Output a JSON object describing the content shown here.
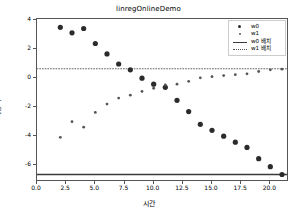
{
  "chart_data": {
    "type": "scatter",
    "title": "linregOnlineDemo",
    "xlabel": "시간",
    "ylabel": "가중치",
    "xlim": [
      0.0,
      21.6
    ],
    "ylim": [
      -7.2,
      4.1
    ],
    "xticks": [
      "0.0",
      "2.5",
      "5.0",
      "7.5",
      "10.0",
      "12.5",
      "15.0",
      "17.5",
      "20.0"
    ],
    "xtick_values": [
      0.0,
      2.5,
      5.0,
      7.5,
      10.0,
      12.5,
      15.0,
      17.5,
      20.0
    ],
    "yticks": [
      "4",
      "2",
      "0",
      "-2",
      "-4",
      "-6"
    ],
    "ytick_values": [
      4,
      2,
      0,
      -2,
      -4,
      -6
    ],
    "grid": false,
    "legend_position": "upper right",
    "x": [
      2,
      3,
      4,
      5,
      6,
      7,
      8,
      9,
      10,
      11,
      12,
      13,
      14,
      15,
      16,
      17,
      18,
      19,
      20,
      21
    ],
    "series": [
      {
        "name": "w0",
        "marker": "circle-large",
        "color": "#2b2b2b",
        "values": [
          3.52,
          3.14,
          3.44,
          2.4,
          1.68,
          0.98,
          0.58,
          0.0,
          -0.42,
          -0.64,
          -1.54,
          -2.32,
          -3.2,
          -3.62,
          -4.02,
          -4.44,
          -4.8,
          -5.58,
          -6.14,
          -6.68
        ]
      },
      {
        "name": "w1",
        "marker": "circle-small",
        "color": "#555555",
        "values": [
          -4.1,
          -3.02,
          -3.4,
          -2.38,
          -1.8,
          -1.38,
          -1.18,
          -0.92,
          -0.7,
          -0.46,
          -0.42,
          -0.22,
          0.02,
          0.1,
          0.18,
          0.24,
          0.3,
          0.46,
          0.58,
          0.62
        ]
      }
    ],
    "reference_lines": [
      {
        "name": "w0 배치",
        "style": "solid",
        "color": "#3a3a3a",
        "value": -6.68
      },
      {
        "name": "w1 배치",
        "style": "dotted",
        "color": "#555555",
        "value": 0.65
      }
    ],
    "legend": [
      {
        "label": "w0",
        "key": "dot-big"
      },
      {
        "label": "w1",
        "key": "dot-small"
      },
      {
        "label": "w0 배치",
        "key": "line-solid"
      },
      {
        "label": "w1 배치",
        "key": "line-dotted"
      }
    ]
  }
}
